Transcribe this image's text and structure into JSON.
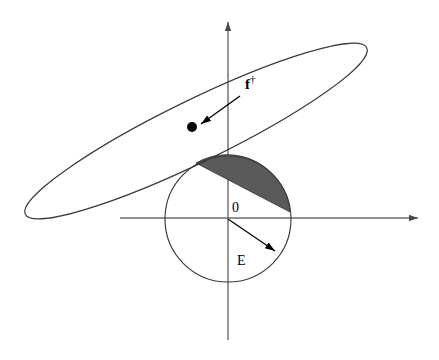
{
  "figure": {
    "name": "ellipse-circle-intersection-diagram",
    "background_color": "#ffffff",
    "stroke_color": "#3a3a3a",
    "axis_color": "#6b6b6b",
    "shade_color": "#5a5a5a",
    "point_color": "#000000",
    "width": 439,
    "height": 360
  },
  "axes": {
    "x_axis": {
      "name": "x-axis",
      "from_x": 120,
      "to_x": 425,
      "y": 218,
      "arrow": "right"
    },
    "y_axis": {
      "name": "y-axis",
      "x": 228,
      "from_y": 340,
      "to_y": 15,
      "arrow": "up"
    }
  },
  "circle": {
    "name": "unit-circle-E",
    "center_x": 228,
    "center_y": 219,
    "radius": 63
  },
  "ellipse": {
    "name": "confidence-ellipse",
    "center_x": 196,
    "center_y": 131,
    "semi_major": 190,
    "semi_minor": 31,
    "rotation_deg": -26
  },
  "shaded_region": {
    "name": "intersection-lens",
    "fill": "#5a5a5a",
    "left_vertex_x": 196,
    "left_vertex_y": 163,
    "right_vertex_x": 290,
    "right_vertex_y": 212
  },
  "point": {
    "name": "f-dagger-point",
    "x": 192,
    "y": 127,
    "radius": 5
  },
  "labels": {
    "origin": "0",
    "radius": "E",
    "point_symbol": "f",
    "point_superscript": "†"
  },
  "annotations": {
    "f_label_x": 245,
    "f_label_y": 89,
    "f_arrow_from_x": 238,
    "f_arrow_from_y": 97,
    "f_arrow_to_x": 200,
    "f_arrow_to_y": 124,
    "radius_arrow_from_x": 228,
    "radius_arrow_from_y": 219,
    "radius_arrow_to_x": 277,
    "radius_arrow_to_y": 253,
    "origin_label_x": 232,
    "origin_label_y": 212,
    "radius_label_x": 237,
    "radius_label_y": 265
  }
}
